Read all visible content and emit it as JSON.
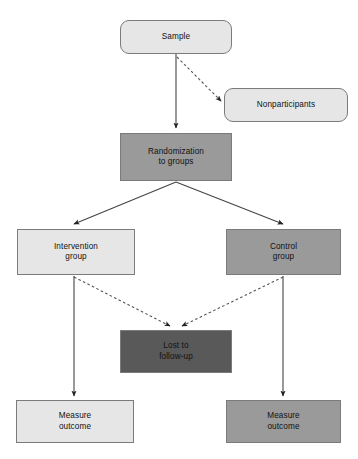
{
  "diagram": {
    "colors": {
      "fill_light": "#e6e6e6",
      "fill_medium": "#9a9a9a",
      "fill_dark": "#595959",
      "border": "#7b7b7b",
      "text": "#111111",
      "background": "#ffffff",
      "edge": "#333333"
    },
    "nodes": {
      "sample": {
        "label": "Sample",
        "shape": "rounded-rectangle",
        "fill": "light"
      },
      "nonparticipants": {
        "label": "Nonparticipants",
        "shape": "rounded-rectangle",
        "fill": "light"
      },
      "randomization": {
        "label": "Randomization\nto groups",
        "shape": "rectangle",
        "fill": "medium"
      },
      "intervention_group": {
        "label": "Intervention\ngroup",
        "shape": "rectangle",
        "fill": "light"
      },
      "control_group": {
        "label": "Control\ngroup",
        "shape": "rectangle",
        "fill": "medium"
      },
      "lost_to_followup": {
        "label": "Lost to\nfollow-up",
        "shape": "rectangle",
        "fill": "dark"
      },
      "measure_outcome_left": {
        "label": "Measure\noutcome",
        "shape": "rectangle",
        "fill": "light"
      },
      "measure_outcome_right": {
        "label": "Measure\noutcome",
        "shape": "rectangle",
        "fill": "medium"
      }
    },
    "edges": [
      {
        "from": "sample",
        "to": "randomization",
        "style": "solid",
        "arrow": "end"
      },
      {
        "from": "sample",
        "to": "nonparticipants",
        "style": "dashed",
        "arrow": "end"
      },
      {
        "from": "randomization",
        "to": "intervention_group",
        "style": "solid",
        "arrow": "end"
      },
      {
        "from": "randomization",
        "to": "control_group",
        "style": "solid",
        "arrow": "end"
      },
      {
        "from": "intervention_group",
        "to": "lost_to_followup",
        "style": "dashed",
        "arrow": "end"
      },
      {
        "from": "control_group",
        "to": "lost_to_followup",
        "style": "dashed",
        "arrow": "end"
      },
      {
        "from": "intervention_group",
        "to": "measure_outcome_left",
        "style": "solid",
        "arrow": "end"
      },
      {
        "from": "control_group",
        "to": "measure_outcome_right",
        "style": "solid",
        "arrow": "end"
      }
    ]
  }
}
